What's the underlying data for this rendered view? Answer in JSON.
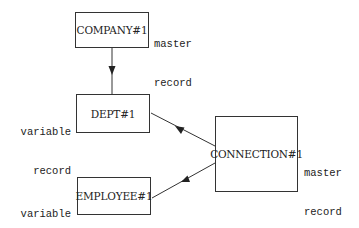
{
  "diagram": {
    "nodes": [
      {
        "id": "company",
        "label": "COMPANY#1",
        "role_line1": "master",
        "role_line2": "record"
      },
      {
        "id": "dept",
        "label": "DEPT#1",
        "role_line1": "variable",
        "role_line2": "record"
      },
      {
        "id": "employee",
        "label": "EMPLOYEE#1",
        "role_line1": "variable",
        "role_line2": "record"
      },
      {
        "id": "connection",
        "label": "CONNECTION#1",
        "role_line1": "master",
        "role_line2": "record"
      }
    ],
    "edges": [
      {
        "from": "company",
        "to": "dept"
      },
      {
        "from": "connection",
        "to": "dept"
      },
      {
        "from": "connection",
        "to": "employee"
      }
    ],
    "colors": {
      "stroke": "#333333",
      "text": "#222222",
      "background": "#ffffff"
    }
  }
}
